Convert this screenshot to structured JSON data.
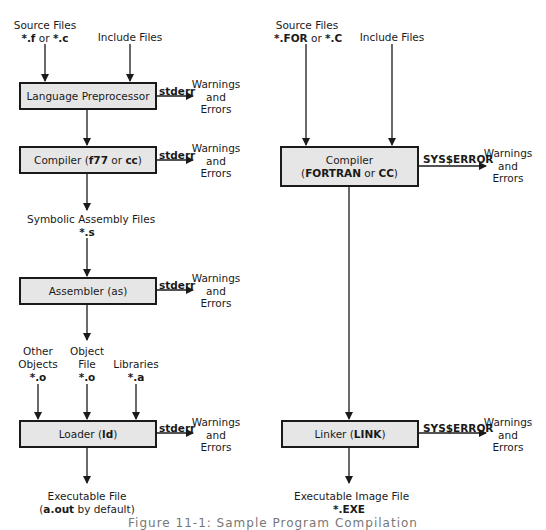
{
  "unix": {
    "source_files": {
      "line1": "Source Files",
      "ext1": "*.f",
      "or": " or ",
      "ext2": "*.c"
    },
    "include_files": "Include Files",
    "preprocessor": {
      "label": "Language Preprocessor",
      "stream": "stderr"
    },
    "compiler": {
      "prefix": "Compiler (",
      "cmd1": "f77",
      "or": " or ",
      "cmd2": "cc",
      "suffix": ")",
      "stream": "stderr"
    },
    "assembly_files": {
      "line1": "Symbolic Assembly Files",
      "ext": "*.s"
    },
    "assembler": {
      "prefix": "Assembler (as)",
      "stream": "stderr"
    },
    "other_objects": {
      "line1": "Other",
      "line2": "Objects",
      "ext": "*.o"
    },
    "object_file": {
      "line1": "Object",
      "line2": "File",
      "ext": "*.o"
    },
    "libraries": {
      "line1": "Libraries",
      "ext": "*.a"
    },
    "loader": {
      "prefix": "Loader (",
      "cmd": "ld",
      "suffix": ")",
      "stream": "stderr"
    },
    "executable": {
      "line1": "Executable File",
      "open": "(",
      "name": "a.out",
      "rest": " by default)"
    }
  },
  "vms": {
    "source_files": {
      "line1": "Source Files",
      "ext1": "*.FOR",
      "or": " or ",
      "ext2": "*.C"
    },
    "include_files": "Include Files",
    "compiler": {
      "line1": "Compiler",
      "open": "(",
      "cmd1": "FORTRAN",
      "or": " or ",
      "cmd2": "CC",
      "close": ")",
      "stream": "SYS$ERROR"
    },
    "linker": {
      "prefix": "Linker (",
      "cmd": "LINK",
      "suffix": ")",
      "stream": "SYS$ERROR"
    },
    "executable": {
      "line1": "Executable Image File",
      "ext": "*.EXE"
    }
  },
  "warnings": {
    "line1": "Warnings",
    "line2": "and",
    "line3": "Errors"
  },
  "caption": "Figure 11-1: Sample Program Compilation",
  "colors": {
    "box_fill": "#e6e6e6",
    "stroke": "#1a1a1a",
    "background": "#ffffff"
  }
}
